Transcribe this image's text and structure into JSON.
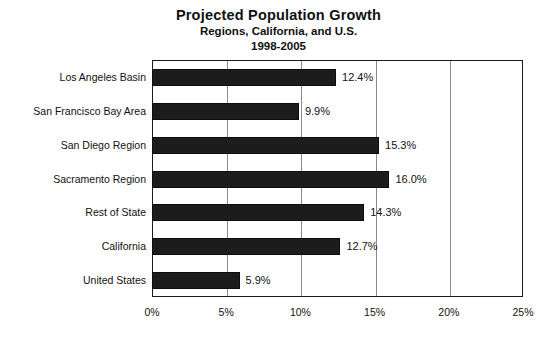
{
  "chart_data": {
    "type": "bar",
    "orientation": "horizontal",
    "title": "Projected Population Growth",
    "subtitle": "Regions, California, and U.S.",
    "period": "1998-2005",
    "xlabel": "",
    "ylabel": "",
    "xlim": [
      0,
      25
    ],
    "xticks": [
      "0%",
      "5%",
      "10%",
      "15%",
      "20%",
      "25%"
    ],
    "xtick_values": [
      0,
      5,
      10,
      15,
      20,
      25
    ],
    "grid": "vertical",
    "legend": "none",
    "bar_color": "#1c1c1c",
    "categories": [
      "Los Angeles Basin",
      "San Francisco Bay Area",
      "San Diego Region",
      "Sacramento Region",
      "Rest of State",
      "California",
      "United States"
    ],
    "values": [
      12.4,
      9.9,
      15.3,
      16.0,
      14.3,
      12.7,
      5.9
    ],
    "labels": [
      "12.4%",
      "9.9%",
      "15.3%",
      "16.0%",
      "14.3%",
      "12.7%",
      "5.9%"
    ]
  }
}
